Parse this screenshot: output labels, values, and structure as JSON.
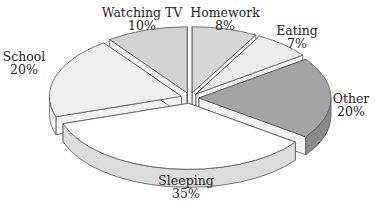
{
  "chart_data": {
    "type": "pie",
    "style": "3d-exploded",
    "title": "",
    "categories": [
      "Homework",
      "Eating",
      "Other",
      "Sleeping",
      "School",
      "Watching TV"
    ],
    "values": [
      8,
      7,
      20,
      35,
      20,
      10
    ],
    "unit": "%",
    "slices": [
      {
        "label": "Homework",
        "value": 8,
        "display": "8%",
        "top": "#d6d6d6",
        "side": "#bdbdbd"
      },
      {
        "label": "Eating",
        "value": 7,
        "display": "7%",
        "top": "#ececec",
        "side": "#d2d2d2"
      },
      {
        "label": "Other",
        "value": 20,
        "display": "20%",
        "top": "#a4a4a4",
        "side": "#8a8a8a"
      },
      {
        "label": "Sleeping",
        "value": 35,
        "display": "35%",
        "top": "#ffffff",
        "side": "#dcdcdc"
      },
      {
        "label": "School",
        "value": 20,
        "display": "20%",
        "top": "#eeeeee",
        "side": "#f6f6f6"
      },
      {
        "label": "Watching TV",
        "value": 10,
        "display": "10%",
        "top": "#d2d2d2",
        "side": "#bbbbbb"
      }
    ],
    "legend": "none (direct labels)"
  },
  "labels": {
    "homework": {
      "name": "Homework",
      "pct": "8%"
    },
    "eating": {
      "name": "Eating",
      "pct": "7%"
    },
    "other": {
      "name": "Other",
      "pct": "20%"
    },
    "sleeping": {
      "name": "Sleeping",
      "pct": "35%"
    },
    "school": {
      "name": "School",
      "pct": "20%"
    },
    "watching_tv": {
      "name": "Watching TV",
      "pct": "10%"
    }
  }
}
